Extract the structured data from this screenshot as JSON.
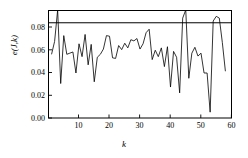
{
  "chart_data": {
    "type": "line",
    "title": "",
    "xlabel": "k",
    "ylabel": "e(J,k)",
    "xlim": [
      0,
      60
    ],
    "ylim": [
      0.0,
      0.092
    ],
    "grid": false,
    "legend": null,
    "xticks": [
      10,
      20,
      30,
      40,
      50,
      60
    ],
    "xticklabels": [
      "10",
      "20",
      "30",
      "40",
      "50",
      "60"
    ],
    "yticks": [
      0.0,
      0.02,
      0.04,
      0.06,
      0.08
    ],
    "yticklabels": [
      "0.00",
      "0.02",
      "0.04",
      "0.06",
      "0.08"
    ],
    "annotations": [
      {
        "name": "threshold-line",
        "type": "hline",
        "y": 0.0815
      }
    ],
    "series": [
      {
        "name": "e(J,k)",
        "color": "#000000",
        "x": [
          1,
          2,
          3,
          4,
          5,
          6,
          7,
          8,
          9,
          10,
          11,
          12,
          13,
          14,
          15,
          16,
          17,
          18,
          19,
          20,
          21,
          22,
          23,
          24,
          25,
          26,
          27,
          28,
          29,
          30,
          31,
          32,
          33,
          34,
          35,
          36,
          37,
          38,
          39,
          40,
          41,
          42,
          43,
          44,
          45,
          46,
          47,
          48,
          49,
          50,
          51,
          52,
          53,
          54,
          55,
          56,
          57,
          58
        ],
        "values": [
          0.0545,
          0.0655,
          0.0925,
          0.0295,
          0.0705,
          0.0545,
          0.0555,
          0.0565,
          0.0385,
          0.0635,
          0.0525,
          0.0715,
          0.0455,
          0.063,
          0.031,
          0.052,
          0.0545,
          0.059,
          0.0705,
          0.07,
          0.0515,
          0.051,
          0.062,
          0.0585,
          0.064,
          0.06,
          0.067,
          0.066,
          0.068,
          0.059,
          0.0635,
          0.073,
          0.076,
          0.05,
          0.058,
          0.0525,
          0.06,
          0.044,
          0.061,
          0.0265,
          0.057,
          0.052,
          0.0215,
          0.0855,
          0.0925,
          0.034,
          0.0555,
          0.0605,
          0.053,
          0.0555,
          0.0385,
          0.0385,
          0.005,
          0.083,
          0.087,
          0.0855,
          0.0645,
          0.04
        ]
      }
    ]
  }
}
